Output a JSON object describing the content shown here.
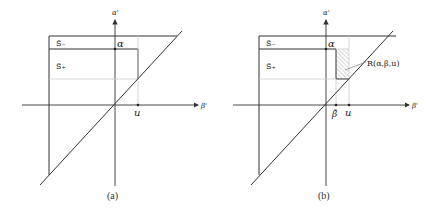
{
  "panels": [
    {
      "id": "a",
      "caption": "(a)",
      "y_axis_label": "α'",
      "x_axis_label": "β'",
      "region_labels": {
        "s_minus": "S̃₋",
        "s_plus": "S̃₊"
      },
      "point_labels": {
        "alpha": "α",
        "u": "u"
      }
    },
    {
      "id": "b",
      "caption": "(b)",
      "y_axis_label": "α'",
      "x_axis_label": "β'",
      "region_labels": {
        "s_minus": "S̃₋",
        "s_plus": "S̃₊"
      },
      "point_labels": {
        "alpha": "α",
        "beta": "β̃",
        "u": "u"
      },
      "hatched_region_label": "R(α,β,u)"
    }
  ],
  "colors": {
    "line": "#333333",
    "light_line": "#c8c8c8",
    "hatch": "#888888"
  }
}
